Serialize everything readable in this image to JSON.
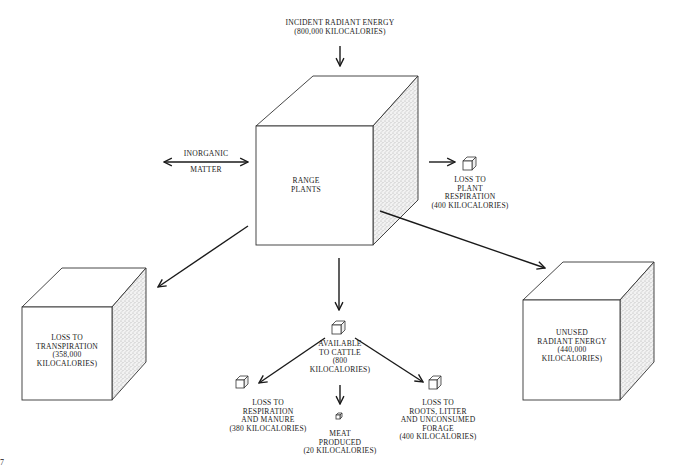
{
  "diagram": {
    "type": "energy-flow",
    "colors": {
      "ink": "#1a1a1a",
      "background": "#ffffff",
      "stipple": "#8a8a8a"
    }
  },
  "nodes": {
    "incident": {
      "lines": [
        "INCIDENT RADIANT ENERGY",
        "(800,000 KILOCALORIES)"
      ]
    },
    "inorganic": {
      "top": "INORGANIC",
      "bottom": "MATTER"
    },
    "range_plants": {
      "lines": [
        "RANGE",
        "PLANTS"
      ]
    },
    "plant_respiration": {
      "lines": [
        "LOSS TO",
        "PLANT",
        "RESPIRATION",
        "(400 KILOCALORIES)"
      ]
    },
    "transpiration": {
      "lines": [
        "LOSS TO",
        "TRANSPIRATION",
        "(358,000",
        "KILOCALORIES)"
      ]
    },
    "unused_radiant": {
      "lines": [
        "UNUSED",
        "RADIANT ENERGY",
        "(440,000",
        "KILOCALORIES)"
      ]
    },
    "available_cattle": {
      "lines": [
        "AVAILABLE",
        "TO CATTLE",
        "(800",
        "KILOCALORIES)"
      ]
    },
    "respiration_manure": {
      "lines": [
        "LOSS TO",
        "RESPIRATION",
        "AND MANURE",
        "(380 KILOCALORIES)"
      ]
    },
    "meat_produced": {
      "lines": [
        "MEAT",
        "PRODUCED",
        "(20 KILOCALORIES)"
      ]
    },
    "roots_litter": {
      "lines": [
        "LOSS TO",
        "ROOTS, LITTER",
        "AND UNCONSUMED",
        "FORAGE",
        "(400 KILOCALORIES)"
      ]
    }
  },
  "page_marker": "7"
}
